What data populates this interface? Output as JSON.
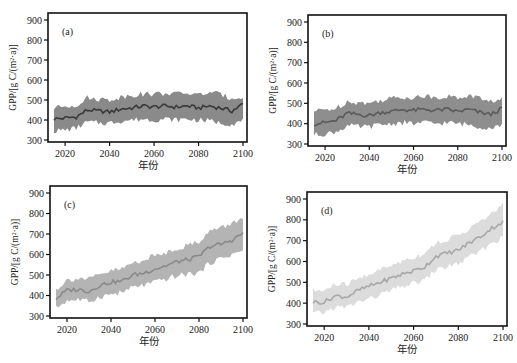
{
  "figure": {
    "xlabel": "年份",
    "ylabel": "GPP/[g C/(m²·a)]"
  },
  "chart_data": [
    {
      "type": "line",
      "panel": "(a)",
      "title": "",
      "xlabel": "年份",
      "ylabel": "GPP/[g C/(m²·a)]",
      "xlim": [
        2010,
        2103
      ],
      "ylim": [
        300,
        950
      ],
      "xticks": [
        2020,
        2040,
        2060,
        2080,
        2100
      ],
      "yticks": [
        300,
        400,
        500,
        600,
        700,
        800,
        900
      ],
      "line_color": "#3a3a3a",
      "band_color": "#8a8a8a",
      "frame": {
        "x0": 48,
        "y0": 13,
        "x1": 247,
        "y1": 142
      },
      "x": [
        2015,
        2020,
        2025,
        2030,
        2035,
        2040,
        2045,
        2050,
        2055,
        2060,
        2065,
        2070,
        2075,
        2080,
        2085,
        2090,
        2095,
        2100
      ],
      "mean": [
        405,
        410,
        415,
        450,
        445,
        440,
        455,
        460,
        470,
        465,
        470,
        465,
        470,
        460,
        470,
        460,
        445,
        480
      ],
      "lower": [
        345,
        350,
        360,
        390,
        385,
        385,
        395,
        400,
        405,
        400,
        405,
        400,
        405,
        400,
        395,
        385,
        380,
        395
      ],
      "upper": [
        460,
        470,
        475,
        510,
        505,
        500,
        515,
        525,
        530,
        530,
        535,
        530,
        535,
        525,
        540,
        525,
        510,
        520
      ]
    },
    {
      "type": "line",
      "panel": "(b)",
      "title": "",
      "xlabel": "年份",
      "ylabel": "GPP/[g C/(m²·a)]",
      "xlim": [
        2010,
        2103
      ],
      "ylim": [
        300,
        950
      ],
      "xticks": [
        2020,
        2040,
        2060,
        2080,
        2100
      ],
      "yticks": [
        300,
        400,
        500,
        600,
        700,
        800,
        900
      ],
      "line_color": "#5a5a5a",
      "band_color": "#8e8e8e",
      "frame": {
        "x0": 308,
        "y0": 15,
        "x1": 506,
        "y1": 146
      },
      "x": [
        2015,
        2020,
        2025,
        2030,
        2035,
        2040,
        2045,
        2050,
        2055,
        2060,
        2065,
        2070,
        2075,
        2080,
        2085,
        2090,
        2095,
        2100
      ],
      "mean": [
        400,
        405,
        415,
        450,
        445,
        440,
        455,
        460,
        470,
        465,
        470,
        465,
        470,
        460,
        470,
        455,
        445,
        475
      ],
      "lower": [
        345,
        350,
        360,
        390,
        385,
        385,
        395,
        400,
        405,
        400,
        405,
        400,
        405,
        400,
        395,
        385,
        380,
        395
      ],
      "upper": [
        460,
        470,
        475,
        510,
        505,
        500,
        515,
        525,
        530,
        530,
        535,
        530,
        535,
        525,
        540,
        525,
        510,
        520
      ]
    },
    {
      "type": "line",
      "panel": "(c)",
      "title": "",
      "xlabel": "年份",
      "ylabel": "GPP/[g C/(m²·a)]",
      "xlim": [
        2010,
        2103
      ],
      "ylim": [
        300,
        950
      ],
      "xticks": [
        2020,
        2040,
        2060,
        2080,
        2100
      ],
      "yticks": [
        300,
        400,
        500,
        600,
        700,
        800,
        900
      ],
      "line_color": "#8a8a8a",
      "band_color": "#b4b4b4",
      "frame": {
        "x0": 50,
        "y0": 186,
        "x1": 247,
        "y1": 318
      },
      "x": [
        2015,
        2020,
        2025,
        2030,
        2035,
        2040,
        2045,
        2050,
        2055,
        2060,
        2065,
        2070,
        2075,
        2080,
        2085,
        2090,
        2095,
        2100
      ],
      "mean": [
        385,
        425,
        430,
        420,
        450,
        465,
        470,
        500,
        510,
        530,
        545,
        565,
        575,
        590,
        640,
        650,
        670,
        705
      ],
      "lower": [
        340,
        375,
        380,
        370,
        395,
        405,
        415,
        440,
        450,
        465,
        480,
        495,
        505,
        510,
        560,
        580,
        600,
        620
      ],
      "upper": [
        430,
        475,
        485,
        480,
        500,
        520,
        530,
        560,
        575,
        595,
        610,
        630,
        645,
        665,
        715,
        730,
        750,
        785
      ]
    },
    {
      "type": "line",
      "panel": "(d)",
      "title": "",
      "xlabel": "年份",
      "ylabel": "GPP/[g C/(m²·a)]",
      "xlim": [
        2010,
        2103
      ],
      "ylim": [
        300,
        950
      ],
      "xticks": [
        2020,
        2040,
        2060,
        2080,
        2100
      ],
      "yticks": [
        300,
        400,
        500,
        600,
        700,
        800,
        900
      ],
      "line_color": "#a8a8a8",
      "band_color": "#dcdcdc",
      "frame": {
        "x0": 307,
        "y0": 192,
        "x1": 507,
        "y1": 326
      },
      "x": [
        2015,
        2020,
        2025,
        2030,
        2035,
        2040,
        2045,
        2050,
        2055,
        2060,
        2065,
        2070,
        2075,
        2080,
        2085,
        2090,
        2095,
        2100
      ],
      "mean": [
        405,
        405,
        435,
        430,
        460,
        480,
        500,
        520,
        540,
        555,
        575,
        625,
        640,
        655,
        690,
        720,
        760,
        790
      ],
      "lower": [
        350,
        355,
        380,
        380,
        405,
        420,
        440,
        460,
        480,
        495,
        510,
        560,
        575,
        590,
        620,
        650,
        690,
        715
      ],
      "upper": [
        460,
        460,
        490,
        490,
        515,
        540,
        560,
        580,
        605,
        620,
        640,
        690,
        705,
        725,
        760,
        790,
        830,
        870
      ]
    }
  ]
}
